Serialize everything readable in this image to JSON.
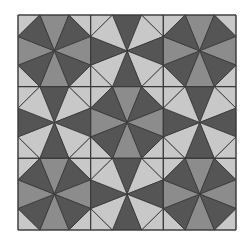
{
  "pattern": {
    "name": "octagon-star-tiling",
    "origin": [
      18,
      15
    ],
    "size": [
      218,
      215
    ],
    "rows": 3,
    "cols": 3,
    "edge_fractions": [
      0.3,
      0.7
    ],
    "cell_types": [
      [
        "A",
        "B",
        "A"
      ],
      [
        "B",
        "A",
        "B"
      ],
      [
        "A",
        "B",
        "A"
      ]
    ],
    "types": {
      "A": {
        "cardinal": "#8c8c8c",
        "diagonal": "#555555",
        "corner": "#c8c8c8"
      },
      "B": {
        "cardinal": "#555555",
        "diagonal": "#c8c8c8",
        "corner": "#c8c8c8"
      }
    },
    "line_color": "#3a3a3a",
    "background": "#ffffff"
  }
}
